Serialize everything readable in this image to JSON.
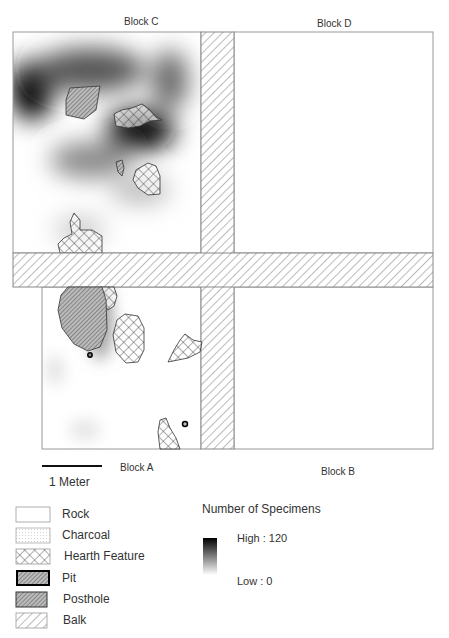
{
  "blocks": {
    "c": {
      "label": "Block C"
    },
    "d": {
      "label": "Block D"
    },
    "a": {
      "label": "Block A"
    },
    "b": {
      "label": "Block B"
    }
  },
  "scale_bar": {
    "label": "1 Meter"
  },
  "legend": {
    "items": [
      {
        "label": "Rock",
        "symbol": "rock"
      },
      {
        "label": "Charcoal",
        "symbol": "charcoal"
      },
      {
        "label": "Hearth Feature",
        "symbol": "hearth"
      },
      {
        "label": "Pit",
        "symbol": "pit"
      },
      {
        "label": "Posthole",
        "symbol": "posthole"
      },
      {
        "label": "Balk",
        "symbol": "balk"
      }
    ]
  },
  "density_legend": {
    "title": "Number of Specimens",
    "high_label": "High : 120",
    "low_label": "Low : 0",
    "high_color": "#000000",
    "low_color": "#ffffff"
  }
}
